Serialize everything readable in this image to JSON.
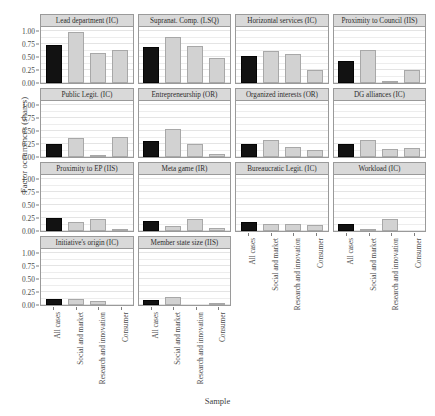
{
  "chart_data": {
    "type": "bar",
    "title": "",
    "xlabel": "Sample",
    "ylabel": "Factor occurrences (shares)",
    "ylim": [
      0,
      1.08
    ],
    "yticks": [
      0.0,
      0.25,
      0.5,
      0.75,
      1.0
    ],
    "ytick_labels": [
      "0.00",
      "0.25",
      "0.50",
      "0.75",
      "1.00"
    ],
    "grid": true,
    "legend": "none",
    "categories": [
      "All cases",
      "Social and market",
      "Research and innovation",
      "Consumer"
    ],
    "facet_layout": {
      "rows": 4,
      "cols": 4,
      "used_in_last_row": 2
    },
    "highlight_category": "All cases",
    "colors": {
      "bar_default": "#d2d2d2",
      "bar_default_border": "#a8a8a8",
      "bar_highlight": "#121212",
      "bar_highlight_border": "#050505",
      "strip_background": "#d9d9d9",
      "panel_border": "#9a9a9a",
      "gridline": "#e4e4e4",
      "text": "#3a3a3a",
      "background": "#ffffff"
    },
    "panels": [
      {
        "title": "Lead department (IC)",
        "values": [
          0.73,
          0.98,
          0.57,
          0.63
        ]
      },
      {
        "title": "Supranat. Comp. (LSQ)",
        "values": [
          0.69,
          0.88,
          0.72,
          0.48
        ]
      },
      {
        "title": "Horizontal services (IC)",
        "values": [
          0.52,
          0.62,
          0.55,
          0.26
        ]
      },
      {
        "title": "Proximity to Council (IIS)",
        "values": [
          0.42,
          0.64,
          0.03,
          0.25
        ]
      },
      {
        "title": "Public Legit. (IC)",
        "values": [
          0.26,
          0.37,
          0.04,
          0.38
        ]
      },
      {
        "title": "Entrepreneurship (OR)",
        "values": [
          0.3,
          0.54,
          0.25,
          0.05
        ]
      },
      {
        "title": "Organized interests (OR)",
        "values": [
          0.25,
          0.33,
          0.2,
          0.14
        ]
      },
      {
        "title": "DG alliances (IC)",
        "values": [
          0.25,
          0.32,
          0.15,
          0.17
        ]
      },
      {
        "title": "Proximity to EP (IIS)",
        "values": [
          0.25,
          0.18,
          0.24,
          0.03
        ]
      },
      {
        "title": "Meta game (IR)",
        "values": [
          0.19,
          0.09,
          0.24,
          0.05
        ]
      },
      {
        "title": "Bureaucratic Legit. (IC)",
        "values": [
          0.17,
          0.14,
          0.14,
          0.12
        ]
      },
      {
        "title": "Workload (IC)",
        "values": [
          0.14,
          0.04,
          0.23,
          0.0
        ]
      },
      {
        "title": "Initiative's origin (IC)",
        "values": [
          0.12,
          0.12,
          0.08,
          0.0
        ]
      },
      {
        "title": "Member state size (IIS)",
        "values": [
          0.1,
          0.16,
          0.0,
          0.03
        ]
      }
    ]
  }
}
